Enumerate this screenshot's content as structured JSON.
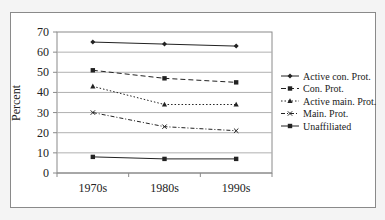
{
  "chart_data": {
    "type": "line",
    "title": "",
    "xlabel": "",
    "ylabel": "Percent",
    "ylim": [
      0,
      70
    ],
    "yticks": [
      0,
      10,
      20,
      30,
      40,
      50,
      60,
      70
    ],
    "grid": true,
    "legend_position": "right",
    "categories": [
      "1970s",
      "1980s",
      "1990s"
    ],
    "series": [
      {
        "name": "Active con. Prot.",
        "values": [
          65,
          64,
          63
        ],
        "line_style": "solid",
        "marker": "diamond"
      },
      {
        "name": "Con. Prot.",
        "values": [
          51,
          47,
          45
        ],
        "line_style": "dashed",
        "marker": "square"
      },
      {
        "name": "Active main. Prot.",
        "values": [
          43,
          34,
          34
        ],
        "line_style": "dotted",
        "marker": "triangle"
      },
      {
        "name": "Main. Prot.",
        "values": [
          30,
          23,
          21
        ],
        "line_style": "dash-dot",
        "marker": "x"
      },
      {
        "name": "Unaffiliated",
        "values": [
          8,
          7,
          7
        ],
        "line_style": "solid",
        "marker": "square"
      }
    ]
  },
  "axis": {
    "y_label": "Percent",
    "y_ticks": [
      "0",
      "10",
      "20",
      "30",
      "40",
      "50",
      "60",
      "70"
    ],
    "x_ticks": [
      "1970s",
      "1980s",
      "1990s"
    ]
  },
  "legend": {
    "items": [
      {
        "label": "Active con. Prot."
      },
      {
        "label": "Con. Prot."
      },
      {
        "label": "Active main. Prot."
      },
      {
        "label": "Main. Prot."
      },
      {
        "label": "Unaffiliated"
      }
    ]
  },
  "colors": {
    "line": "#222222",
    "grid": "#b0b0b0",
    "frame": "#8a8a8a"
  }
}
